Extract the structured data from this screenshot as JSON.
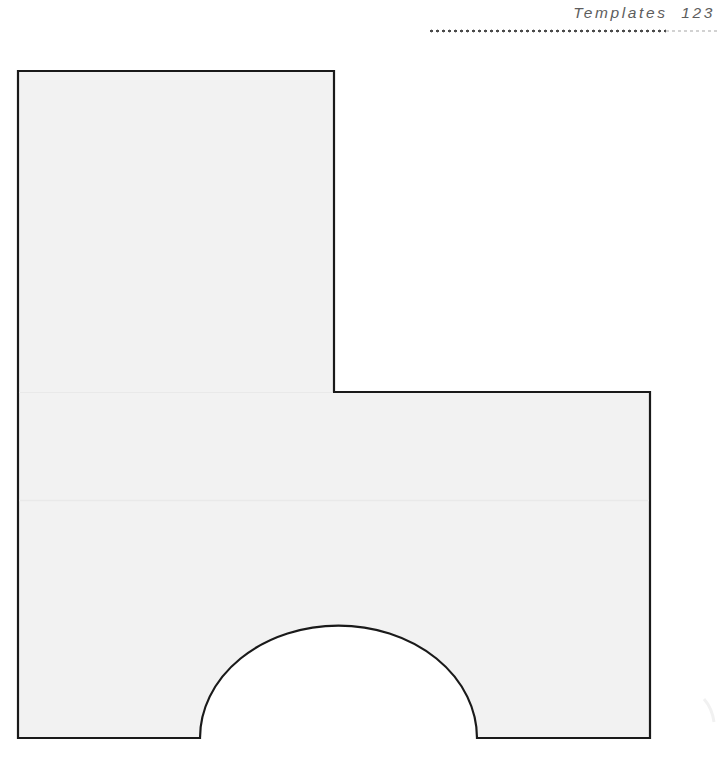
{
  "page": {
    "background_color": "#ffffff",
    "width": 720,
    "height": 773
  },
  "running_head": {
    "text": "Templates  123",
    "section_label": "Templates",
    "page_number": "123",
    "text_color": "#5d5d5d",
    "rule": {
      "style": "dotted",
      "dark_color": "#4a4a4a",
      "faded_color": "#d2d2d2",
      "start_x": 430,
      "fade_start_x": 666,
      "end_x": 720,
      "y": 31
    }
  },
  "figure": {
    "name": "L-shaped template outline with semicircular notch",
    "fill_color": "#f2f2f2",
    "stroke_color": "#1a1a1a",
    "stroke_width": 2,
    "fold_line_color": "#e9e9e9",
    "vertices": [
      {
        "label": "top-left",
        "x": 18,
        "y": 71
      },
      {
        "label": "top-right-upper",
        "x": 334,
        "y": 71
      },
      {
        "label": "step-inner-corner",
        "x": 334,
        "y": 392
      },
      {
        "label": "top-right-lower",
        "x": 650,
        "y": 392
      },
      {
        "label": "bottom-right",
        "x": 650,
        "y": 738
      },
      {
        "label": "notch-right-foot",
        "x": 477,
        "y": 738
      },
      {
        "label": "notch-left-foot",
        "x": 200,
        "y": 738
      },
      {
        "label": "bottom-left",
        "x": 18,
        "y": 738
      }
    ],
    "notch": {
      "shape": "semicircle",
      "center_x": 338,
      "center_y": 738,
      "radius_x": 138,
      "radius_y": 112,
      "apex_y": 626
    },
    "fold_lines": [
      {
        "y": 392,
        "x1": 18,
        "x2": 334
      },
      {
        "y": 500,
        "x1": 18,
        "x2": 650
      }
    ]
  },
  "margin_mark": {
    "name": "page-edge-artifact",
    "color": "#f0f0f0",
    "x": 706,
    "y": 698
  }
}
